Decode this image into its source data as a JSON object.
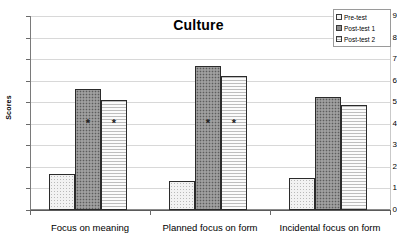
{
  "chart_data": {
    "type": "bar",
    "title": "Culture",
    "xlabel": "",
    "ylabel": "Scores",
    "ylim": [
      0,
      9
    ],
    "yticks": [
      0,
      1,
      2,
      3,
      4,
      5,
      6,
      7,
      8,
      9
    ],
    "grid": true,
    "legend_position": "top-right",
    "categories": [
      "Focus on meaning",
      "Planned focus on form",
      "Incidental focus on form"
    ],
    "series": [
      {
        "name": "Pre-test",
        "values": [
          1.65,
          1.35,
          1.5
        ]
      },
      {
        "name": "Post-test 1",
        "values": [
          5.6,
          6.7,
          5.25
        ]
      },
      {
        "name": "Post-test 2",
        "values": [
          5.1,
          6.2,
          4.85
        ]
      }
    ],
    "annotations": [
      {
        "symbol": "*",
        "series": "Post-test 1",
        "category": "Focus on meaning",
        "y": 4.1
      },
      {
        "symbol": "*",
        "series": "Post-test 2",
        "category": "Focus on meaning",
        "y": 4.1
      },
      {
        "symbol": "*",
        "series": "Post-test 1",
        "category": "Planned focus on form",
        "y": 4.1
      },
      {
        "symbol": "*",
        "series": "Post-test 2",
        "category": "Planned focus on form",
        "y": 4.1
      }
    ],
    "colors": {
      "pre_test": "#f2f2f2",
      "post_test_1": "#8e8e8e",
      "post_test_2": "#f4f4f4",
      "bar_outline": "#2b2b2b",
      "gridline": "#d8d8d8",
      "axis": "#6a6a6a"
    }
  }
}
